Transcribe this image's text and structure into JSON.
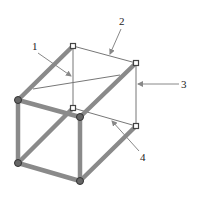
{
  "figure": {
    "cropped_header": "",
    "colors": {
      "thick_beam": "#8a8a8a",
      "thin_line": "#777777",
      "node_fill": "#555555",
      "arrow": "#888888",
      "label": "#222222"
    },
    "nodes": {
      "back_top_left": [
        73,
        46
      ],
      "back_top_right": [
        136,
        63
      ],
      "back_bottom_left": [
        73,
        108
      ],
      "back_bottom_right": [
        136,
        126
      ],
      "front_top_left": [
        18,
        100
      ],
      "front_top_right": [
        80,
        117
      ],
      "front_bottom_left": [
        18,
        163
      ],
      "front_bottom_right": [
        80,
        181
      ]
    },
    "labels": [
      {
        "id": "1",
        "text": "1",
        "x": 32,
        "y": 50,
        "arrow_from": [
          38,
          53
        ],
        "arrow_to": [
          71,
          76
        ]
      },
      {
        "id": "2",
        "text": "2",
        "x": 120,
        "y": 25,
        "arrow_from": [
          121,
          29
        ],
        "arrow_to": [
          110,
          54
        ]
      },
      {
        "id": "3",
        "text": "3",
        "x": 182,
        "y": 88,
        "arrow_from": [
          179,
          84
        ],
        "arrow_to": [
          138,
          84
        ]
      },
      {
        "id": "4",
        "text": "4",
        "x": 141,
        "y": 160,
        "arrow_from": [
          139,
          151
        ],
        "arrow_to": [
          112,
          121
        ]
      }
    ]
  }
}
